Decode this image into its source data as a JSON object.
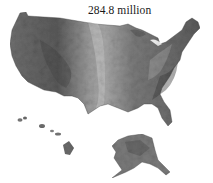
{
  "map": {
    "title": "284.8 million",
    "type": "shaded-relief",
    "regions": [
      {
        "name": "Contiguous United States",
        "label": ""
      },
      {
        "name": "Hawaii",
        "label": ""
      },
      {
        "name": "Alaska",
        "label": ""
      }
    ],
    "colors": {
      "background": "#ffffff",
      "land_dark": "#4a4a4a",
      "land_mid": "#7d7d7d",
      "land_light": "#b5b5b5",
      "text": "#1a1a1a"
    }
  }
}
